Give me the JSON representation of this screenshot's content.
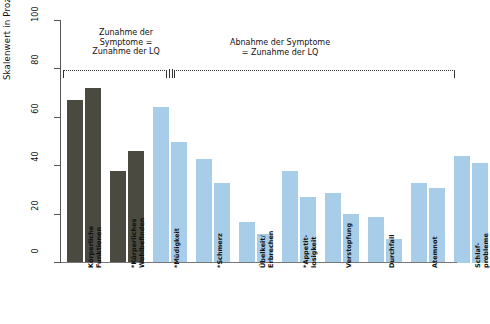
{
  "chart_data": {
    "type": "bar",
    "title": "",
    "xlabel": "",
    "ylabel": "Skalenwert in Prozent",
    "ylim": [
      0,
      100
    ],
    "yticks": [
      0,
      20,
      40,
      60,
      80,
      100
    ],
    "grid": false,
    "legend": "none",
    "categories": [
      "Körperliche\nFunktionen",
      "*Körperliches\nWohlbefinden",
      "*Müdigkeit",
      "*Schmerz",
      "Übelkeit/\nErbrechen",
      "*Appetit-\nlosigkeit",
      "Verstopfung",
      "Durchfall",
      "Atemnot",
      "Schlaf-\nprobleme"
    ],
    "series": [
      {
        "name": "Serie 1",
        "values": [
          67,
          38,
          64,
          43,
          17,
          38,
          29,
          19,
          33,
          44
        ]
      },
      {
        "name": "Serie 2",
        "values": [
          72,
          46,
          50,
          33,
          12,
          27,
          20,
          10,
          31,
          41
        ]
      }
    ],
    "series_colors": {
      "dark": "#4a4a40",
      "blue": "#a8cde8"
    },
    "group_color_map": [
      "dark",
      "dark",
      "blue",
      "blue",
      "blue",
      "blue",
      "blue",
      "blue",
      "blue",
      "blue"
    ],
    "annotations": [
      {
        "id": "left-annotation",
        "text": "Zunahme der\nSymptome =\nZunahme der LQ"
      },
      {
        "id": "right-annotation",
        "text": "Abnahme der Symptome\n= Zunahme der LQ"
      }
    ]
  }
}
